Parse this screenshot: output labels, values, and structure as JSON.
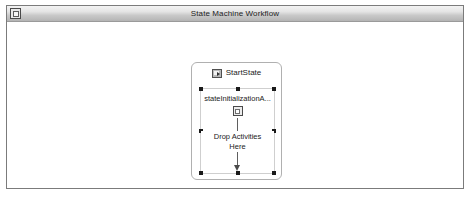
{
  "window": {
    "title": "State Machine Workflow",
    "control_icon": "window-restore-icon"
  },
  "breadcrumb": {
    "root": {
      "icon": "workflow-icon",
      "label": "Workflow1"
    },
    "separator": ":",
    "current": {
      "icon": "start-state-icon",
      "label": "StartState"
    }
  },
  "designer": {
    "state": {
      "icon": "start-state-icon",
      "title": "StartState",
      "activity": {
        "label": "stateInitializationA...",
        "glyph": "state-initialization-icon",
        "selected": true
      },
      "drop_target": {
        "line1": "Drop Activities",
        "line2": "Here"
      }
    }
  },
  "colors": {
    "window_border": "#7b7b7b",
    "titlebar_top": "#f3f3f3",
    "titlebar_bottom": "#b4b4b4",
    "canvas": "#ffffff",
    "state_border": "#b0b0b0",
    "selection_handle": "#1a1a1a",
    "connector": "#5f5f5f"
  }
}
